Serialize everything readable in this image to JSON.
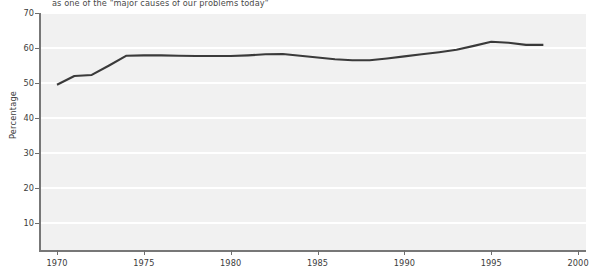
{
  "chart_data": {
    "type": "line",
    "title": "as one of the \"major causes of our problems today\"",
    "xlabel": "",
    "ylabel": "Percentage",
    "xlim": [
      1970,
      2000
    ],
    "ylim": [
      0,
      70
    ],
    "grid": true,
    "legend": "none",
    "x_ticks": [
      "1970",
      "1975",
      "1980",
      "1985",
      "1990",
      "1995",
      "2000"
    ],
    "y_ticks": [
      "10",
      "20",
      "30",
      "40",
      "50",
      "60",
      "70"
    ],
    "line_color": "#3a3a3a",
    "plot_background": "#f1f1f1",
    "gridline_color": "#ffffff",
    "series": [
      {
        "name": "Percentage",
        "x": [
          1970,
          1971,
          1972,
          1973,
          1974,
          1975,
          1976,
          1977,
          1978,
          1979,
          1980,
          1981,
          1982,
          1983,
          1984,
          1985,
          1986,
          1987,
          1988,
          1989,
          1990,
          1991,
          1992,
          1993,
          1994,
          1995,
          1996,
          1997,
          1998
        ],
        "values": [
          49.5,
          52.0,
          52.3,
          55.0,
          57.8,
          57.9,
          57.9,
          57.8,
          57.7,
          57.7,
          57.7,
          57.9,
          58.2,
          58.3,
          57.8,
          57.3,
          56.8,
          56.5,
          56.5,
          57.0,
          57.6,
          58.2,
          58.8,
          59.5,
          60.6,
          61.8,
          61.5,
          60.9,
          60.9
        ]
      }
    ]
  }
}
